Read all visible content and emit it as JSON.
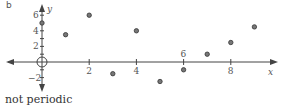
{
  "panel_label": "b",
  "caption": "not periodic",
  "colors": {
    "axis": "#444444",
    "point_fill": "#777777",
    "point_stroke": "#333333",
    "text": "#555555"
  },
  "chart_data": {
    "type": "scatter",
    "title": "",
    "xlabel": "x",
    "ylabel": "y",
    "x": [
      0,
      1,
      2,
      3,
      4,
      5,
      6,
      7,
      8,
      9
    ],
    "y": [
      5,
      3.5,
      6,
      -1.5,
      4,
      -2.5,
      -1,
      1,
      2.5,
      4.5
    ],
    "x_ticks": [
      2,
      4,
      6,
      8
    ],
    "y_ticks": [
      -2,
      2,
      4,
      6
    ],
    "xlim": [
      -1.5,
      10.5
    ],
    "ylim": [
      -3.5,
      7
    ],
    "grid": false,
    "legend": null,
    "annotations": [
      "open circle at origin",
      "not periodic"
    ],
    "axes_with_arrows": true
  }
}
